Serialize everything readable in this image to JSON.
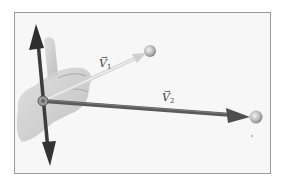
{
  "figure": {
    "colors": {
      "frame_border": "#9a9a9a",
      "frame_background": "#f7f7f7",
      "hand": "#c8c8c8",
      "axis_arrow": "#3a3a3a",
      "v1_arrow": "#d8d8d8",
      "v2_arrow": "#555555",
      "sphere": "#bdbdbd"
    },
    "vectors": [
      {
        "id": "v1",
        "symbol": "V",
        "subscript": "1",
        "arrow": "→",
        "tip": [
          150,
          51
        ]
      },
      {
        "id": "v2",
        "symbol": "V",
        "subscript": "2",
        "arrow": "→",
        "tip": [
          256,
          117
        ]
      }
    ],
    "origin": [
      43,
      101
    ],
    "axis": {
      "top_tip": [
        36,
        25
      ],
      "bottom_tip": [
        50,
        166
      ]
    }
  }
}
